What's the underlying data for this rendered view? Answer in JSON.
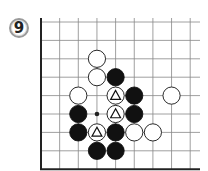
{
  "problem": {
    "number": "9"
  },
  "board": {
    "origin_x": 41,
    "origin_y": 22,
    "step_x": 18.65,
    "step_y": 18.4,
    "cols": 9,
    "rows": 9,
    "right_extent": 200,
    "edges": [
      "left",
      "bottom"
    ],
    "star_points": [
      [
        3,
        5
      ]
    ],
    "stones": [
      {
        "color": "white",
        "col": 3,
        "row": 2
      },
      {
        "color": "white",
        "col": 3,
        "row": 3
      },
      {
        "color": "black",
        "col": 4,
        "row": 3
      },
      {
        "color": "white",
        "col": 2,
        "row": 4
      },
      {
        "color": "white",
        "col": 4,
        "row": 4,
        "mark": "triangle"
      },
      {
        "color": "black",
        "col": 5,
        "row": 4
      },
      {
        "color": "white",
        "col": 7,
        "row": 4
      },
      {
        "color": "black",
        "col": 2,
        "row": 5
      },
      {
        "color": "white",
        "col": 4,
        "row": 5,
        "mark": "triangle"
      },
      {
        "color": "black",
        "col": 5,
        "row": 5
      },
      {
        "color": "black",
        "col": 2,
        "row": 6
      },
      {
        "color": "white",
        "col": 3,
        "row": 6,
        "mark": "triangle"
      },
      {
        "color": "black",
        "col": 4,
        "row": 6
      },
      {
        "color": "white",
        "col": 5,
        "row": 6
      },
      {
        "color": "white",
        "col": 6,
        "row": 6
      },
      {
        "color": "black",
        "col": 3,
        "row": 7
      },
      {
        "color": "black",
        "col": 4,
        "row": 7
      }
    ]
  },
  "colors": {
    "black_stone": "#111111",
    "white_stone": "#ffffff",
    "grid": "#888888",
    "edge": "#222222"
  }
}
